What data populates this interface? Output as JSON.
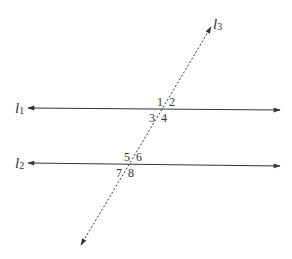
{
  "diagram": {
    "type": "parallel lines cut by a transversal",
    "lines": [
      {
        "id": "l1",
        "name": "l",
        "subscript": "1",
        "style": "solid",
        "arrows": "both"
      },
      {
        "id": "l2",
        "name": "l",
        "subscript": "2",
        "style": "solid",
        "arrows": "both"
      },
      {
        "id": "l3",
        "name": "l",
        "subscript": "3",
        "style": "dashed",
        "arrows": "both",
        "role": "transversal"
      }
    ],
    "angles": {
      "l1": {
        "top_left": "1",
        "top_right": "2",
        "bottom_left": "3",
        "bottom_right": "4"
      },
      "l2": {
        "top_left": "5",
        "top_right": "6",
        "bottom_left": "7",
        "bottom_right": "8"
      }
    },
    "colors": {
      "line": "#333333",
      "background": "#ffffff"
    }
  }
}
